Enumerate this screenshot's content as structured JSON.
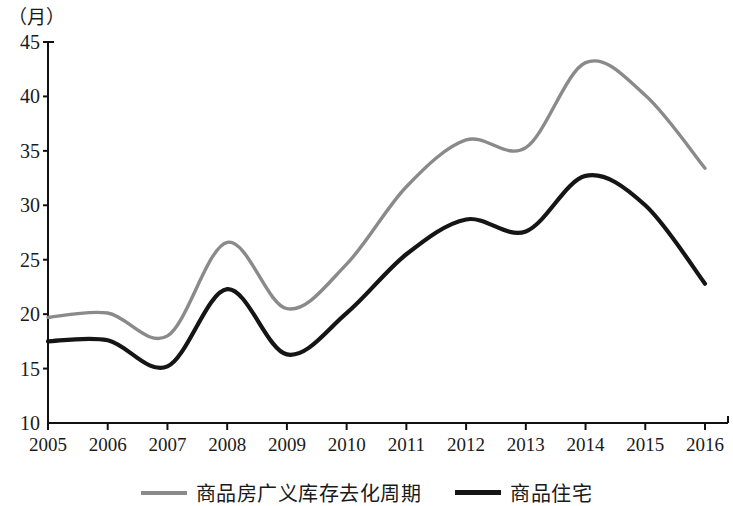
{
  "chart_data": {
    "type": "line",
    "title": "",
    "subtitle": "",
    "xlabel": "",
    "ylabel": "（月）",
    "unit_label": "（月）",
    "grid": false,
    "legend_position": "bottom",
    "xlim": [
      2005,
      2016
    ],
    "ylim": [
      10,
      45
    ],
    "x": [
      2005,
      2006,
      2007,
      2008,
      2009,
      2010,
      2011,
      2012,
      2013,
      2014,
      2015,
      2016
    ],
    "categories": [
      "2005",
      "2006",
      "2007",
      "2008",
      "2009",
      "2010",
      "2011",
      "2012",
      "2013",
      "2014",
      "2015",
      "2016"
    ],
    "xticks": [
      "2005",
      "2006",
      "2007",
      "2008",
      "2009",
      "2010",
      "2011",
      "2012",
      "2013",
      "2014",
      "2015",
      "2016"
    ],
    "yticks": [
      "45",
      "40",
      "35",
      "30",
      "25",
      "20",
      "15",
      "10"
    ],
    "ytick_values": [
      45,
      40,
      35,
      30,
      25,
      20,
      15,
      10
    ],
    "series": [
      {
        "name": "商品房广义库存去化周期",
        "color": "#8a8a8a",
        "width": 3.4,
        "values": [
          19.7,
          20.1,
          18.0,
          26.6,
          20.5,
          24.6,
          31.7,
          36.0,
          35.3,
          43.1,
          40.1,
          33.4
        ]
      },
      {
        "name": "商品住宅",
        "color": "#151515",
        "width": 4.2,
        "values": [
          17.5,
          17.6,
          15.2,
          22.3,
          16.3,
          20.1,
          25.5,
          28.7,
          27.6,
          32.7,
          30.0,
          22.8
        ]
      }
    ]
  },
  "legend": {
    "items": [
      {
        "label": "商品房广义库存去化周期",
        "color": "#8a8a8a"
      },
      {
        "label": "商品住宅",
        "color": "#151515"
      }
    ]
  },
  "axes": {
    "y_unit": "（月）",
    "y_labels": [
      "45",
      "40",
      "35",
      "30",
      "25",
      "20",
      "15",
      "10"
    ],
    "x_labels": [
      "2005",
      "2006",
      "2007",
      "2008",
      "2009",
      "2010",
      "2011",
      "2012",
      "2013",
      "2014",
      "2015",
      "2016"
    ]
  }
}
